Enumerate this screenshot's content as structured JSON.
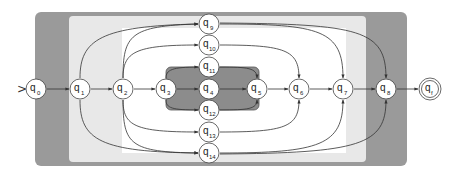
{
  "diagram": {
    "type": "finite-automaton",
    "start_marker": ">",
    "colors": {
      "outer_region": "#9a9a9a",
      "middle_region": "#e6e6e6",
      "inner_region": "#ffffff",
      "core_region": "#8a8a8a",
      "edge": "#333333",
      "node_fill": "#ffffff",
      "node_stroke": "#444444"
    },
    "regions": [
      {
        "id": "outer",
        "label": ""
      },
      {
        "id": "middle",
        "label": ""
      },
      {
        "id": "inner",
        "label": ""
      },
      {
        "id": "core",
        "label": ""
      }
    ],
    "nodes": [
      {
        "id": "q0",
        "base": "q",
        "sub": "0",
        "start": true,
        "accepting": false
      },
      {
        "id": "q1",
        "base": "q",
        "sub": "1",
        "start": false,
        "accepting": false
      },
      {
        "id": "q2",
        "base": "q",
        "sub": "2",
        "start": false,
        "accepting": false
      },
      {
        "id": "q3",
        "base": "q",
        "sub": "3",
        "start": false,
        "accepting": false
      },
      {
        "id": "q4",
        "base": "q",
        "sub": "4",
        "start": false,
        "accepting": false
      },
      {
        "id": "q5",
        "base": "q",
        "sub": "5",
        "start": false,
        "accepting": false
      },
      {
        "id": "q6",
        "base": "q",
        "sub": "6",
        "start": false,
        "accepting": false
      },
      {
        "id": "q7",
        "base": "q",
        "sub": "7",
        "start": false,
        "accepting": false
      },
      {
        "id": "q8",
        "base": "q",
        "sub": "8",
        "start": false,
        "accepting": false
      },
      {
        "id": "q9",
        "base": "q",
        "sub": "9",
        "start": false,
        "accepting": false
      },
      {
        "id": "q10",
        "base": "q",
        "sub": "10",
        "start": false,
        "accepting": false
      },
      {
        "id": "q11",
        "base": "q",
        "sub": "11",
        "start": false,
        "accepting": false
      },
      {
        "id": "q12",
        "base": "q",
        "sub": "12",
        "start": false,
        "accepting": false
      },
      {
        "id": "q13",
        "base": "q",
        "sub": "13",
        "start": false,
        "accepting": false
      },
      {
        "id": "q14",
        "base": "q",
        "sub": "14",
        "start": false,
        "accepting": false
      },
      {
        "id": "qf",
        "base": "q",
        "sub": "f",
        "start": false,
        "accepting": true
      }
    ],
    "edges": [
      [
        "q0",
        "q1"
      ],
      [
        "q1",
        "q2"
      ],
      [
        "q2",
        "q3"
      ],
      [
        "q3",
        "q4"
      ],
      [
        "q4",
        "q5"
      ],
      [
        "q5",
        "q6"
      ],
      [
        "q6",
        "q7"
      ],
      [
        "q7",
        "q8"
      ],
      [
        "q8",
        "qf"
      ],
      [
        "q1",
        "q9"
      ],
      [
        "q1",
        "q14"
      ],
      [
        "q2",
        "q9"
      ],
      [
        "q2",
        "q10"
      ],
      [
        "q2",
        "q13"
      ],
      [
        "q2",
        "q14"
      ],
      [
        "q3",
        "q11"
      ],
      [
        "q3",
        "q12"
      ],
      [
        "q11",
        "q5"
      ],
      [
        "q12",
        "q5"
      ],
      [
        "q10",
        "q6"
      ],
      [
        "q13",
        "q6"
      ],
      [
        "q9",
        "q7"
      ],
      [
        "q14",
        "q7"
      ],
      [
        "q9",
        "q8"
      ],
      [
        "q14",
        "q8"
      ]
    ]
  }
}
